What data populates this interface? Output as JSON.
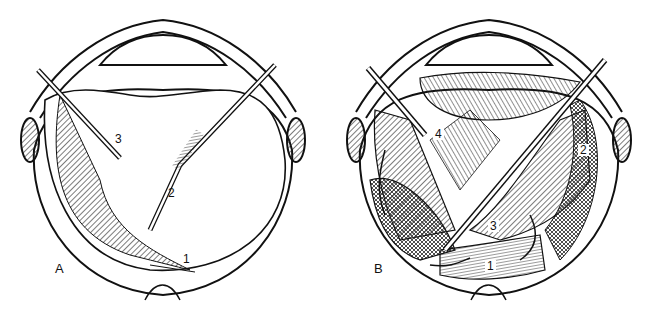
{
  "figure": {
    "panels": [
      {
        "id": "A",
        "label": "A",
        "callouts": [
          "1",
          "2",
          "3"
        ]
      },
      {
        "id": "B",
        "label": "B",
        "callouts": [
          "1",
          "2",
          "3",
          "4"
        ]
      }
    ]
  },
  "colors": {
    "ink": "#111111",
    "paper": "#ffffff",
    "hatch": "#333333"
  }
}
